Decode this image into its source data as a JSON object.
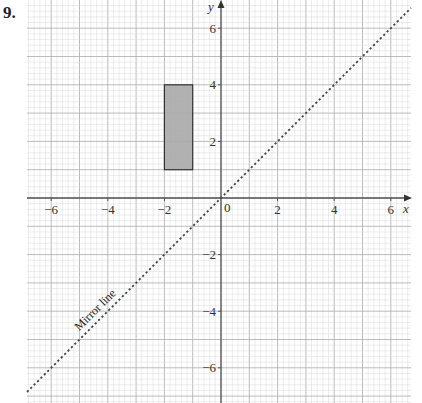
{
  "question": {
    "number": "9."
  },
  "colors": {
    "minor_grid": "#d8d8d8",
    "major_grid": "#b4b4b4",
    "axis": "#555555",
    "shape_fill": "#a9a9a9",
    "shape_stroke": "#333333",
    "mirror_line": "#444444"
  },
  "chart_data": {
    "type": "scatter",
    "title": "",
    "xlabel": "x",
    "ylabel": "y",
    "xlim": [
      -6.9,
      6.7
    ],
    "ylim": [
      -7.2,
      7.0
    ],
    "grid": {
      "major_step": 1,
      "minor_step": 0.2
    },
    "x_ticks": [
      {
        "value": -6,
        "label": "−6"
      },
      {
        "value": -4,
        "label": "−4"
      },
      {
        "value": -2,
        "label": "−2"
      },
      {
        "value": 0,
        "label": "0"
      },
      {
        "value": 2,
        "label": "2"
      },
      {
        "value": 4,
        "label": "4"
      },
      {
        "value": 6,
        "label": "6"
      }
    ],
    "y_ticks": [
      {
        "value": 6,
        "label": "6"
      },
      {
        "value": 4,
        "label": "4"
      },
      {
        "value": 2,
        "label": "2"
      },
      {
        "value": -2,
        "label": "−2"
      },
      {
        "value": -4,
        "label": "−4"
      },
      {
        "value": -6,
        "label": "−6"
      }
    ],
    "shapes": [
      {
        "name": "rectangle",
        "type": "rectangle",
        "x": [
          -2,
          -1
        ],
        "y": [
          1,
          4
        ],
        "filled": true
      }
    ],
    "lines": [
      {
        "name": "Mirror line",
        "equation": "y = x",
        "style": "dotted",
        "label": "Mirror line"
      }
    ]
  }
}
